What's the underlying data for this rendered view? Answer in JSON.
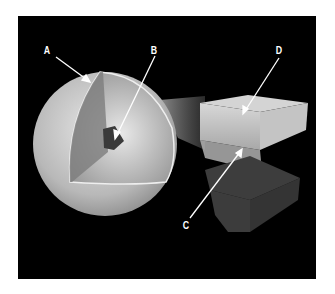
{
  "figure": {
    "labels": [
      {
        "id": "A",
        "text": "A"
      },
      {
        "id": "B",
        "text": "B"
      },
      {
        "id": "C",
        "text": "C"
      },
      {
        "id": "D",
        "text": "D"
      }
    ],
    "colors": {
      "background": "#000000",
      "page": "#ffffff",
      "surface": "#c8c8c8",
      "core": "#3a3a3a"
    }
  }
}
